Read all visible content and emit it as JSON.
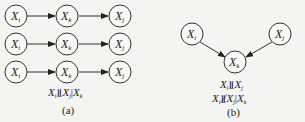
{
  "panel_a": {
    "rows": [
      {
        "nodes": [
          "X_i",
          "X_k",
          "X_j"
        ]
      },
      {
        "nodes": [
          "X_i",
          "X_k",
          "X_j"
        ]
      },
      {
        "nodes": [
          "X_i",
          "X_k",
          "X_j"
        ]
      }
    ],
    "node_labels": {
      "i": "X",
      "i_sub": "i",
      "k": "X",
      "k_sub": "k",
      "j": "X",
      "j_sub": "j"
    },
    "statement": {
      "a": "X",
      "a_sub": "i",
      "rel": "⫫",
      "b": "X",
      "b_sub": "j",
      "cond": "|",
      "c": "X",
      "c_sub": "k"
    },
    "caption": "(a)"
  },
  "panel_b": {
    "nodes": {
      "i": "X",
      "i_sub": "i",
      "k": "X",
      "k_sub": "k",
      "j": "X",
      "j_sub": "j"
    },
    "statement1": {
      "a": "X",
      "a_sub": "i",
      "rel": "⫫",
      "b": "X",
      "b_sub": "j"
    },
    "statement2": {
      "a": "X",
      "a_sub": "i",
      "rel": "⫫̸",
      "b": "X",
      "b_sub": "j",
      "cond": "|",
      "c": "X",
      "c_sub": "k"
    },
    "caption": "(b)"
  }
}
